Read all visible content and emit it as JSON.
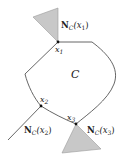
{
  "figure": {
    "set_label": "C",
    "points": [
      {
        "id": "x1",
        "label": "x",
        "sub": "1"
      },
      {
        "id": "x2",
        "label": "x",
        "sub": "2"
      },
      {
        "id": "x3",
        "label": "x",
        "sub": "3"
      }
    ],
    "normal_cones": [
      {
        "id": "N_x1",
        "bold": "N",
        "sub": "C",
        "arg": "(x",
        "argsub": "1",
        "close": ")"
      },
      {
        "id": "N_x2",
        "bold": "N",
        "sub": "C",
        "arg": "(x",
        "argsub": "2",
        "close": ")"
      },
      {
        "id": "N_x3",
        "bold": "N",
        "sub": "C",
        "arg": "(x",
        "argsub": "3",
        "close": ")"
      }
    ],
    "colors": {
      "cone_fill": "#c8c8c8",
      "boundary": "#555555"
    }
  }
}
